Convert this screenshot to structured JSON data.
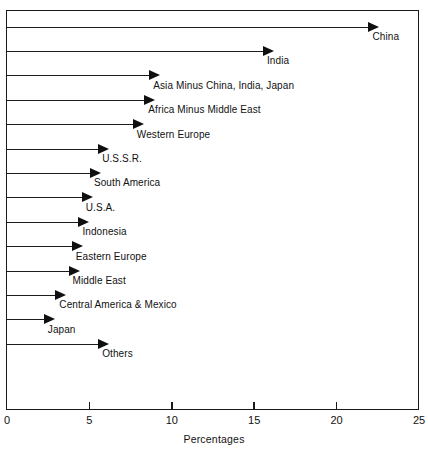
{
  "chart_data": {
    "type": "bar",
    "orientation": "horizontal",
    "title": "",
    "xlabel": "Percentages",
    "ylabel": "",
    "xlim": [
      0,
      25
    ],
    "ylim": null,
    "grid": false,
    "legend": null,
    "xticks": [
      0,
      5,
      10,
      15,
      20,
      25
    ],
    "xtick_labels": [
      "0",
      "5",
      "10",
      "15",
      "20",
      "25"
    ],
    "categories": [
      "China",
      "India",
      "Asia Minus China, India, Japan",
      "Africa Minus Middle East",
      "Western Europe",
      "U.S.S.R.",
      "South America",
      "U.S.A.",
      "Indonesia",
      "Eastern Europe",
      "Middle East",
      "Central America & Mexico",
      "Japan",
      "Others"
    ],
    "values": [
      22.6,
      16.2,
      9.3,
      9.0,
      8.3,
      6.2,
      5.7,
      5.2,
      5.0,
      4.6,
      4.4,
      3.6,
      2.9,
      6.2
    ],
    "marker_style": "arrow-head",
    "series_color": "#101010",
    "annotations": [
      "Each horizontal arrow begins at 0 percent and its solid triangular head marks the category value.",
      "The category name is printed below and to the right of each arrow head."
    ]
  },
  "axis": {
    "x_title": "Percentages",
    "ticks": [
      {
        "value": "0",
        "pct": 0
      },
      {
        "value": "5",
        "pct": 5
      },
      {
        "value": "10",
        "pct": 10
      },
      {
        "value": "15",
        "pct": 15
      },
      {
        "value": "20",
        "pct": 20
      },
      {
        "value": "25",
        "pct": 25
      }
    ]
  },
  "rows": [
    {
      "label": "China",
      "value": 22.6,
      "row": 0
    },
    {
      "label": "India",
      "value": 16.2,
      "row": 1
    },
    {
      "label": "Asia Minus China, India, Japan",
      "value": 9.3,
      "row": 2
    },
    {
      "label": "Africa Minus Middle East",
      "value": 9.0,
      "row": 3
    },
    {
      "label": "Western Europe",
      "value": 8.3,
      "row": 4
    },
    {
      "label": "U.S.S.R.",
      "value": 6.2,
      "row": 5
    },
    {
      "label": "South America",
      "value": 5.7,
      "row": 6
    },
    {
      "label": "U.S.A.",
      "value": 5.2,
      "row": 7
    },
    {
      "label": "Indonesia",
      "value": 5.0,
      "row": 8
    },
    {
      "label": "Eastern Europe",
      "value": 4.6,
      "row": 9
    },
    {
      "label": "Middle East",
      "value": 4.4,
      "row": 10
    },
    {
      "label": "Central America & Mexico",
      "value": 3.6,
      "row": 11
    },
    {
      "label": "Japan",
      "value": 2.9,
      "row": 12
    },
    {
      "label": "Others",
      "value": 6.2,
      "row": 13
    }
  ],
  "colors": {
    "ink": "#111111",
    "frame": "#1a1a1a",
    "arrow": "#101010",
    "background": "#ffffff"
  }
}
